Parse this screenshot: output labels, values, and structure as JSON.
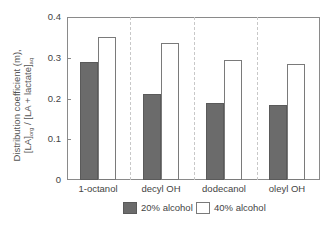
{
  "chart_data": {
    "type": "bar",
    "title": "",
    "xlabel": "",
    "ylabel": "Distribution coefficient (m), [LA]org / [LA + lactate]aq",
    "ylabel_line1": "Distribution coefficient (m),",
    "ylabel_line2_parts": [
      "[LA]",
      "org",
      " / [LA + lactate]",
      "aq"
    ],
    "ylim": [
      0,
      0.4
    ],
    "yticks": [
      "0",
      "0.1",
      "0.2",
      "0.3",
      "0.4"
    ],
    "categories": [
      "1-octanol",
      "decyl OH",
      "dodecanol",
      "oleyl OH"
    ],
    "series": [
      {
        "name": "20% alcohol",
        "color": "#6b6b6b",
        "values": [
          0.29,
          0.21,
          0.19,
          0.185
        ]
      },
      {
        "name": "40% alcohol",
        "color": "#ffffff",
        "values": [
          0.35,
          0.335,
          0.295,
          0.285
        ]
      }
    ],
    "grid": false,
    "category_separators": "dashed vertical lines",
    "legend_position": "bottom"
  }
}
